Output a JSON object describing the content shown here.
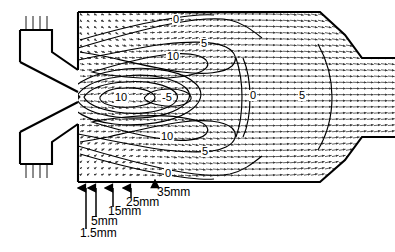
{
  "figure": {
    "type": "cfd-vector-contour-plot"
  },
  "chart_data": {
    "type": "contour_vector_field",
    "title": "",
    "xlabel": "",
    "ylabel": "",
    "grid": false,
    "legend": "none",
    "contour_levels": [
      -10,
      -5,
      0,
      5,
      10
    ],
    "contour_labels": [
      {
        "text": "0",
        "x": 178,
        "y": 20,
        "level": 0
      },
      {
        "text": "5",
        "x": 206,
        "y": 44,
        "level": 5
      },
      {
        "text": "10",
        "x": 172,
        "y": 57,
        "level": 10
      },
      {
        "text": "10",
        "x": 120,
        "y": 98,
        "level": 10
      },
      {
        "text": "-5",
        "x": 167,
        "y": 98,
        "level": -5
      },
      {
        "text": "0",
        "x": 255,
        "y": 96,
        "level": 0
      },
      {
        "text": "5",
        "x": 304,
        "y": 96,
        "level": 5
      },
      {
        "text": "10",
        "x": 166,
        "y": 137,
        "level": 10
      },
      {
        "text": "5",
        "x": 207,
        "y": 152,
        "level": 5
      },
      {
        "text": "0",
        "x": 170,
        "y": 174,
        "level": 0
      }
    ],
    "station_arrows": [
      {
        "label": "1.5mm",
        "x": 86,
        "label_x": 80,
        "label_y": 233
      },
      {
        "label": "5mm",
        "x": 96,
        "label_x": 91,
        "label_y": 221
      },
      {
        "label": "15mm",
        "x": 113,
        "label_x": 108,
        "label_y": 211
      },
      {
        "label": "25mm",
        "x": 131,
        "label_x": 126,
        "label_y": 202
      },
      {
        "label": "35mm",
        "x": 155,
        "label_x": 157,
        "label_y": 192
      }
    ],
    "axis_y": 185,
    "geometry": {
      "chamber_top_y": 12,
      "chamber_bottom_y": 182,
      "chamber_left_x": 78,
      "outlet_duct_top_y": 58,
      "outlet_duct_bottom_y": 137,
      "outlet_right_x": 395
    }
  },
  "colors": {
    "wall": "#000000",
    "vector": "#3a3a3a",
    "contour": "#000000",
    "background": "#ffffff",
    "label_text": "#000000"
  },
  "labels": {
    "contour_0_top": "0",
    "contour_5_top": "5",
    "contour_10_top": "10",
    "contour_10_mid": "10",
    "contour_neg5_mid": "-5",
    "contour_0_right": "0",
    "contour_5_right": "5",
    "contour_10_bot": "10",
    "contour_5_bot": "5",
    "contour_0_bot": "0",
    "station_1": "1.5mm",
    "station_2": "5mm",
    "station_3": "15mm",
    "station_4": "25mm",
    "station_5": "35mm"
  }
}
